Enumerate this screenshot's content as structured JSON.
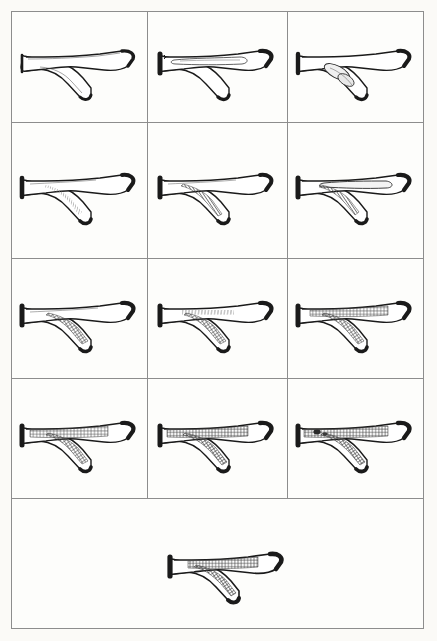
{
  "figure": {
    "panel_count": 13,
    "rows": 5,
    "columns": 3,
    "border_color": "#8d8d8d",
    "ink_color": "#1a1a1a",
    "background_color": "#fdfdfb",
    "hatch_color": "#6a6a6a"
  },
  "panels": [
    {
      "id": "panel-1",
      "row": 1,
      "column": 1,
      "label": "Normal bifurcation, no lesion",
      "lesion_type": "none",
      "lesion_location": "none",
      "stenosis_percent": 0,
      "shading": "clear lumen"
    },
    {
      "id": "panel-2",
      "row": 1,
      "column": 2,
      "label": "Early intimal thickening in main trunk",
      "lesion_type": "outline",
      "lesion_location": "main trunk",
      "stenosis_percent": 5,
      "shading": "thin outlined pocket"
    },
    {
      "id": "panel-3",
      "row": 1,
      "column": 3,
      "label": "Focal lesion at bifurcation apex",
      "lesion_type": "outline-oval",
      "lesion_location": "branch origin",
      "stenosis_percent": 10,
      "shading": "outlined oval plaque"
    },
    {
      "id": "panel-4",
      "row": 2,
      "column": 1,
      "label": "Faint streak along branch wall",
      "lesion_type": "faint-streak",
      "lesion_location": "branch wall",
      "stenosis_percent": 8,
      "shading": "light stipple streak"
    },
    {
      "id": "panel-5",
      "row": 2,
      "column": 2,
      "label": "Hatched plaque filling branch",
      "lesion_type": "hatch",
      "lesion_location": "branch",
      "stenosis_percent": 30,
      "shading": "vertical hatching"
    },
    {
      "id": "panel-6",
      "row": 2,
      "column": 3,
      "label": "Branch hatching with trunk pocket",
      "lesion_type": "hatch-and-outline",
      "lesion_location": "branch and main trunk",
      "stenosis_percent": 35,
      "shading": "vertical hatching plus outlined trunk pocket"
    },
    {
      "id": "panel-7",
      "row": 3,
      "column": 1,
      "label": "Cross-hatched plaque at branch origin",
      "lesion_type": "cross-hatch",
      "lesion_location": "branch origin",
      "stenosis_percent": 40,
      "shading": "cross hatching"
    },
    {
      "id": "panel-8",
      "row": 3,
      "column": 2,
      "label": "Trunk streaking with branch cross-hatch",
      "lesion_type": "cross-hatch",
      "lesion_location": "main trunk and branch",
      "stenosis_percent": 50,
      "shading": "fine trunk hatching plus branch cross hatching"
    },
    {
      "id": "panel-9",
      "row": 3,
      "column": 3,
      "label": "Extensive cross-hatching through trunk and branch",
      "lesion_type": "cross-hatch",
      "lesion_location": "main trunk and branch",
      "stenosis_percent": 65,
      "shading": "dense cross hatching"
    },
    {
      "id": "panel-10",
      "row": 4,
      "column": 1,
      "label": "Confluent plaque across bifurcation",
      "lesion_type": "cross-hatch",
      "lesion_location": "main trunk and branch",
      "stenosis_percent": 70,
      "shading": "dense cross hatching"
    },
    {
      "id": "panel-11",
      "row": 4,
      "column": 2,
      "label": "Near-circumferential plaque",
      "lesion_type": "cross-hatch",
      "lesion_location": "main trunk and branch",
      "stenosis_percent": 80,
      "shading": "dense cross hatching"
    },
    {
      "id": "panel-12",
      "row": 4,
      "column": 3,
      "label": "Plaque extending to proximal trunk",
      "lesion_type": "cross-hatch",
      "lesion_location": "proximal trunk, distal trunk and branch",
      "stenosis_percent": 85,
      "shading": "dense cross hatching with dark nodules"
    },
    {
      "id": "panel-13",
      "row": 5,
      "column": 1,
      "label": "End-stage diffuse plaque",
      "lesion_type": "cross-hatch",
      "lesion_location": "entire bifurcation",
      "stenosis_percent": 90,
      "shading": "dense cross hatching, reduced scale"
    }
  ]
}
